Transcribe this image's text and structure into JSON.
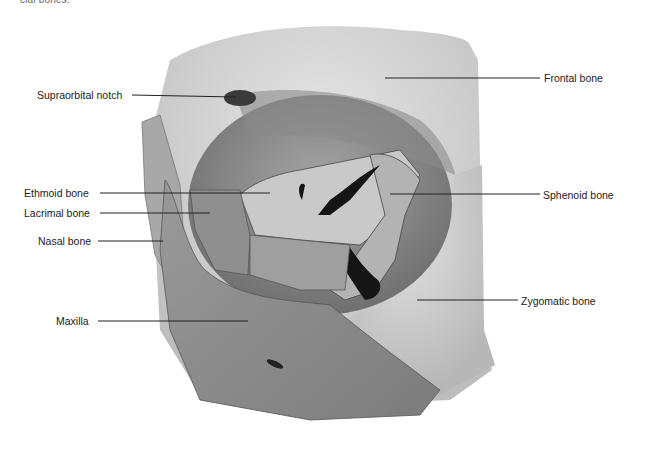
{
  "caption": "cial bones.",
  "labels": {
    "supraorbital_notch": "Supraorbital notch",
    "ethmoid_bone": "Ethmoid bone",
    "lacrimal_bone": "Lacrimal bone",
    "nasal_bone": "Nasal bone",
    "maxilla": "Maxilla",
    "frontal_bone": "Frontal bone",
    "sphenoid_bone": "Sphenoid bone",
    "zygomatic_bone": "Zygomatic bone"
  },
  "colors": {
    "background": "#ffffff",
    "leader_line": "#222222",
    "text": "#222222",
    "bone_light": "#dcdcdc",
    "bone_mid": "#a9a9a9",
    "bone_dark": "#7a7a7a",
    "foramen": "#151515"
  }
}
